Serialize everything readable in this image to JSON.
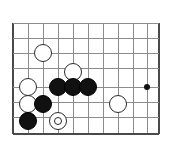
{
  "diagram": {
    "kind": "go-board-diagram",
    "colors": {
      "background": "#ffffff",
      "grid_line": "#8c8c8c",
      "edge_line": "#4a4a4a",
      "black_stone": "#111111",
      "white_stone": "#ffffff",
      "stone_outline": "#2b2b2b"
    },
    "board": {
      "origin_x": 13,
      "origin_y": 23,
      "cell_width": 15,
      "cell_height": 15,
      "columns": 10,
      "rows": 8,
      "vertical_lines": [
        13,
        28,
        43,
        58,
        73,
        88,
        103,
        118,
        133,
        147,
        158
      ],
      "horizontal_lines": [
        23,
        38,
        53,
        68,
        87,
        102,
        117,
        133
      ],
      "edges": {
        "left": 13,
        "right": 158,
        "bottom": 133
      }
    },
    "star_points": [
      {
        "name": "hoshi-right",
        "x": 147,
        "y": 87,
        "radius": 3
      }
    ],
    "stones": [
      {
        "id": "white-1",
        "color": "white",
        "x": 43,
        "y": 53,
        "radius": 9,
        "marked": false
      },
      {
        "id": "white-2",
        "color": "white",
        "x": 73,
        "y": 72,
        "radius": 9,
        "marked": false
      },
      {
        "id": "white-3",
        "color": "white",
        "x": 28,
        "y": 87,
        "radius": 9,
        "marked": false
      },
      {
        "id": "black-1",
        "color": "black",
        "x": 58,
        "y": 87,
        "radius": 9,
        "marked": false
      },
      {
        "id": "black-2",
        "color": "black",
        "x": 73,
        "y": 87,
        "radius": 9,
        "marked": false
      },
      {
        "id": "black-3",
        "color": "black",
        "x": 88,
        "y": 87,
        "radius": 9,
        "marked": false
      },
      {
        "id": "white-4",
        "color": "white",
        "x": 28,
        "y": 104,
        "radius": 9,
        "marked": false
      },
      {
        "id": "black-4",
        "color": "black",
        "x": 43,
        "y": 104,
        "radius": 9,
        "marked": false
      },
      {
        "id": "white-5",
        "color": "white",
        "x": 118,
        "y": 104,
        "radius": 9,
        "marked": false
      },
      {
        "id": "black-5",
        "color": "black",
        "x": 28,
        "y": 121,
        "radius": 9,
        "marked": false
      },
      {
        "id": "white-6",
        "color": "white",
        "x": 58,
        "y": 121,
        "radius": 9,
        "marked": true,
        "marker_radius": 4
      }
    ]
  }
}
